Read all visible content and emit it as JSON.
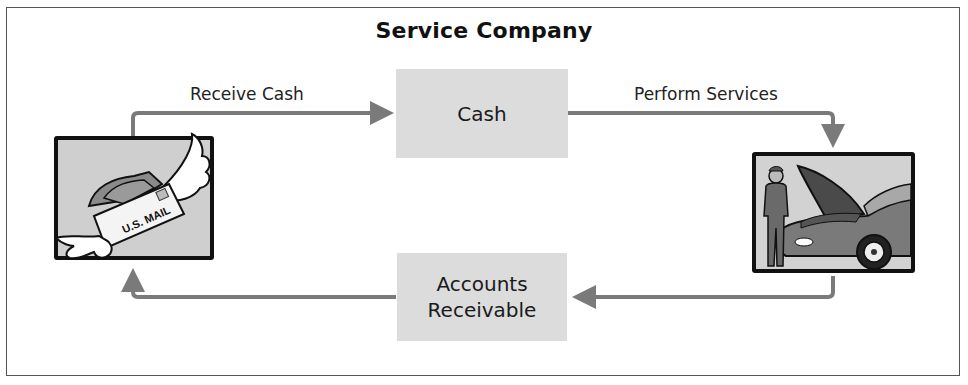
{
  "diagram": {
    "title": "Service Company",
    "nodes": {
      "cash": {
        "label": "Cash"
      },
      "accounts_receivable": {
        "label_line1": "Accounts",
        "label_line2": "Receivable"
      }
    },
    "edges": {
      "receive_cash": {
        "label": "Receive Cash",
        "from": "mail-illustration",
        "to": "cash"
      },
      "perform_services": {
        "label": "Perform Services",
        "from": "cash",
        "to": "mechanic-illustration"
      },
      "services_to_ar": {
        "label": "",
        "from": "mechanic-illustration",
        "to": "accounts_receivable"
      },
      "ar_to_mail": {
        "label": "",
        "from": "accounts_receivable",
        "to": "mail-illustration"
      }
    },
    "illustrations": {
      "mail": {
        "text": "U.S. MAIL",
        "description": "winged envelope with cash"
      },
      "mechanic": {
        "description": "mechanic beside car with open hood"
      }
    },
    "colors": {
      "arrow": "#7a7a7a",
      "box_fill": "#dcdcdc",
      "frame": "#555555"
    }
  }
}
